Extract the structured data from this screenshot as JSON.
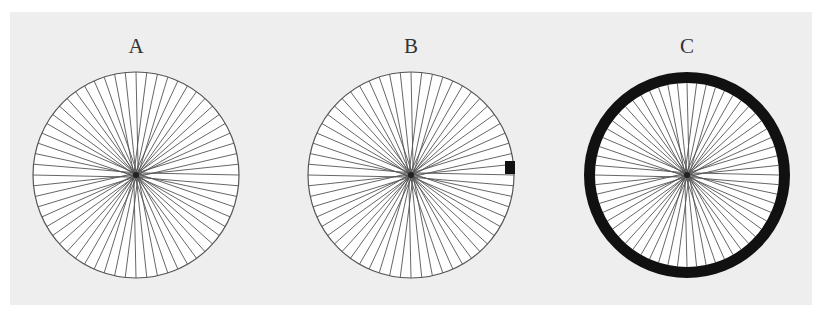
{
  "diagram": {
    "background_color": "#eeeeee",
    "wheel_fill": "#ffffff",
    "line_color": "#555555",
    "spoke_count": 60,
    "panels": [
      {
        "id": "A",
        "label": "A",
        "center_x": 136,
        "center_y": 175,
        "radius": 103,
        "rim": "thin",
        "rim_width": 1.2,
        "marker": null
      },
      {
        "id": "B",
        "label": "B",
        "center_x": 411,
        "center_y": 175,
        "radius": 103,
        "rim": "thin",
        "rim_width": 1.2,
        "marker": {
          "description": "black square marker at right edge of wheel, in sector just above horizontal spoke",
          "x": 505,
          "y": 161,
          "width": 10,
          "height": 13,
          "color": "#111111"
        }
      },
      {
        "id": "C",
        "label": "C",
        "center_x": 687,
        "center_y": 175,
        "radius": 103,
        "rim": "thick",
        "rim_width": 11,
        "marker": null
      }
    ]
  }
}
